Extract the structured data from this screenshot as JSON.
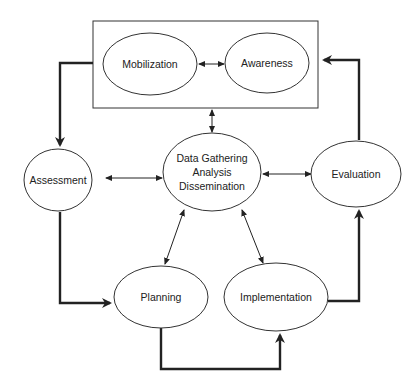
{
  "diagram": {
    "group_box": {
      "label": "",
      "contains": [
        "mobilization",
        "awareness"
      ]
    },
    "nodes": {
      "mobilization": {
        "label": "Mobilization"
      },
      "awareness": {
        "label": "Awareness"
      },
      "assessment": {
        "label": "Assessment"
      },
      "data_gathering": {
        "lines": [
          "Data Gathering",
          "Analysis",
          "Dissemination"
        ]
      },
      "evaluation": {
        "label": "Evaluation"
      },
      "planning": {
        "label": "Planning"
      },
      "implementation": {
        "label": "Implementation"
      }
    },
    "cycle_edges": [
      {
        "from": "group_box",
        "to": "assessment",
        "style": "thick"
      },
      {
        "from": "assessment",
        "to": "planning",
        "style": "thick"
      },
      {
        "from": "planning",
        "to": "implementation",
        "style": "thick"
      },
      {
        "from": "implementation",
        "to": "evaluation",
        "style": "thick"
      },
      {
        "from": "evaluation",
        "to": "group_box",
        "style": "thick"
      }
    ],
    "bidirectional_edges": [
      {
        "a": "mobilization",
        "b": "awareness"
      },
      {
        "a": "data_gathering",
        "b": "group_box"
      },
      {
        "a": "data_gathering",
        "b": "assessment"
      },
      {
        "a": "data_gathering",
        "b": "evaluation"
      },
      {
        "a": "data_gathering",
        "b": "planning"
      },
      {
        "a": "data_gathering",
        "b": "implementation"
      }
    ],
    "colors": {
      "stroke": "#222222",
      "background": "#ffffff"
    }
  }
}
